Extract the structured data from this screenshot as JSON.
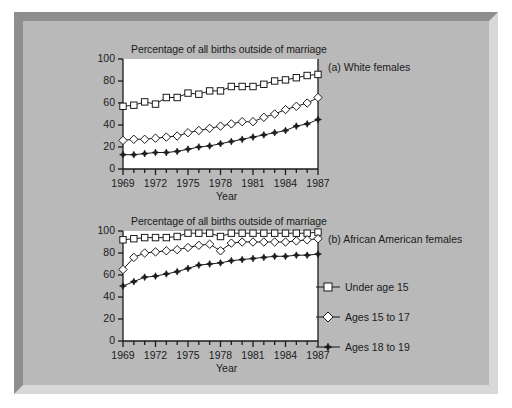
{
  "figure": {
    "background_color": "#b9b9b9",
    "plot_background_color": "#ffffff",
    "line_color": "#1b1b1b"
  },
  "panel_a": {
    "tag": "(a) White females",
    "title": "Percentage of all births outside of marriage",
    "xlabel": "Year",
    "ylabel": ""
  },
  "panel_b": {
    "tag": "(b) African American females",
    "title": "Percentage of all births outside of marriage",
    "xlabel": "Year",
    "ylabel": ""
  },
  "legend": {
    "items": [
      {
        "label": "Under age 15",
        "marker": "open-square"
      },
      {
        "label": "Ages 15 to 17",
        "marker": "open-diamond"
      },
      {
        "label": "Ages 18 to 19",
        "marker": "filled-dot"
      }
    ]
  },
  "axis": {
    "y_ticks": [
      0,
      20,
      40,
      60,
      80,
      100
    ],
    "y_tick_labels": [
      "0",
      "20",
      "40",
      "60",
      "80",
      "100"
    ],
    "x_tick_labels": [
      "1969",
      "1972",
      "1975",
      "1978",
      "1981",
      "1984",
      "1987"
    ],
    "x_labeled_years": [
      1969,
      1972,
      1975,
      1978,
      1981,
      1984,
      1987
    ],
    "xlim": [
      1969,
      1987
    ],
    "ylim": [
      0,
      100
    ]
  },
  "chart_data": [
    {
      "type": "line",
      "title": "Percentage of all births outside of marriage",
      "subtitle": "(a) White females",
      "xlabel": "Year",
      "ylabel": "",
      "xlim": [
        1969,
        1987
      ],
      "ylim": [
        0,
        100
      ],
      "grid": false,
      "legend_position": "right-outside",
      "x": [
        1969,
        1970,
        1971,
        1972,
        1973,
        1974,
        1975,
        1976,
        1977,
        1978,
        1979,
        1980,
        1981,
        1982,
        1983,
        1984,
        1985,
        1986,
        1987
      ],
      "series": [
        {
          "name": "Under age 15",
          "marker": "open-square",
          "values": [
            57,
            58,
            61,
            59,
            65,
            65,
            69,
            68,
            71,
            71,
            75,
            75,
            75,
            77,
            80,
            81,
            83,
            85,
            86
          ]
        },
        {
          "name": "Ages 15 to 17",
          "marker": "open-diamond",
          "values": [
            26,
            27,
            27,
            28,
            29,
            30,
            33,
            35,
            37,
            39,
            41,
            43,
            43,
            47,
            50,
            54,
            57,
            60,
            65
          ]
        },
        {
          "name": "Ages 18 to 19",
          "marker": "filled-dot",
          "values": [
            13,
            13,
            14,
            15,
            15,
            16,
            18,
            20,
            21,
            23,
            25,
            27,
            29,
            31,
            33,
            35,
            39,
            41,
            45
          ]
        }
      ]
    },
    {
      "type": "line",
      "title": "Percentage of all births outside of marriage",
      "subtitle": "(b) African American females",
      "xlabel": "Year",
      "ylabel": "",
      "xlim": [
        1969,
        1987
      ],
      "ylim": [
        0,
        100
      ],
      "grid": false,
      "legend_position": "right-outside",
      "x": [
        1969,
        1970,
        1971,
        1972,
        1973,
        1974,
        1975,
        1976,
        1977,
        1978,
        1979,
        1980,
        1981,
        1982,
        1983,
        1984,
        1985,
        1986,
        1987
      ],
      "series": [
        {
          "name": "Under age 15",
          "marker": "open-square",
          "values": [
            92,
            93,
            94,
            94,
            94,
            95,
            98,
            98,
            98,
            95,
            98,
            98,
            98,
            98,
            98,
            98,
            98,
            98,
            99
          ]
        },
        {
          "name": "Ages 15 to 17",
          "marker": "open-diamond",
          "values": [
            65,
            76,
            80,
            81,
            82,
            83,
            85,
            87,
            88,
            82,
            89,
            90,
            90,
            90,
            90,
            90,
            91,
            92,
            93
          ]
        },
        {
          "name": "Ages 18 to 19",
          "marker": "filled-dot",
          "values": [
            50,
            54,
            58,
            59,
            61,
            63,
            66,
            69,
            70,
            71,
            73,
            74,
            75,
            76,
            77,
            77,
            78,
            78,
            79
          ]
        }
      ]
    }
  ]
}
